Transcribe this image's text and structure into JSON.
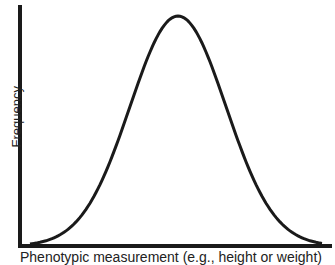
{
  "chart_data": {
    "type": "line",
    "title": "",
    "xlabel": "Phenotypic measurement (e.g., height or weight)",
    "ylabel": "Frequency",
    "x": [
      0,
      0.1,
      0.2,
      0.3,
      0.4,
      0.5,
      0.6,
      0.7,
      0.8,
      0.9,
      1.0
    ],
    "values": [
      0.02,
      0.08,
      0.25,
      0.55,
      0.88,
      1.0,
      0.88,
      0.55,
      0.25,
      0.08,
      0.02
    ],
    "peak": {
      "x": 0.5,
      "y": 1.0
    },
    "grid": false,
    "ticks": false,
    "line_color": "#1a1a1a"
  }
}
